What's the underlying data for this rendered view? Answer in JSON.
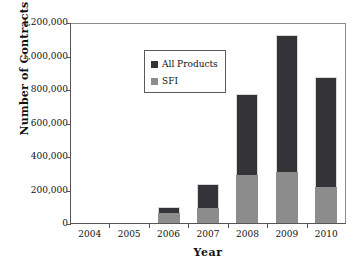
{
  "chart_data": {
    "type": "bar",
    "subtype": "stacked-bar",
    "title": "",
    "xlabel": "Year",
    "ylabel": "Number of Contracts",
    "categories": [
      "2004",
      "2005",
      "2006",
      "2007",
      "2008",
      "2009",
      "2010"
    ],
    "series": [
      {
        "name": "SFI",
        "color": "#8c8c8c",
        "values": [
          0,
          0,
          60000,
          90000,
          288000,
          305000,
          215000
        ]
      },
      {
        "name": "All Products",
        "color": "#333338",
        "note": "upper dark segment: total minus SFI",
        "values": [
          0,
          0,
          35000,
          143000,
          482000,
          817000,
          655000
        ]
      }
    ],
    "totals": [
      0,
      0,
      95000,
      233000,
      770000,
      1122000,
      870000
    ],
    "ylim": [
      0,
      1200000
    ],
    "ytick_values": [
      0,
      200000,
      400000,
      600000,
      800000,
      1000000,
      1200000
    ],
    "ytick_labels": [
      "0",
      "200,000",
      "400,000",
      "600,000",
      "800,000",
      "1,000,000",
      "1,200,000"
    ],
    "grid": false,
    "legend_position": "top-left",
    "legend_entries": [
      {
        "label": "All Products",
        "color": "#333338",
        "swatch": "dark-square-icon"
      },
      {
        "label": "SFI",
        "color": "#8c8c8c",
        "swatch": "gray-square-icon"
      }
    ]
  },
  "axes": {
    "y_title": "Number of Contracts",
    "x_title": "Year"
  },
  "colors": {
    "background": "#ffffff",
    "all_products": "#333338",
    "sfi": "#8c8c8c",
    "axis": "#555555",
    "frame": "#8a8a8a",
    "text": "#111111"
  }
}
